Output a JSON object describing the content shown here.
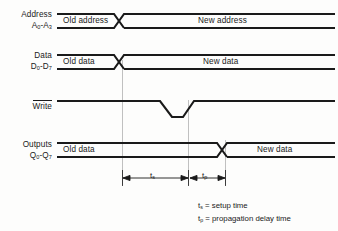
{
  "diagram": {
    "background_color": "#fdfdfc",
    "line_color": "#1a1a1a",
    "guide_color": "#b4b4b4",
    "signals": [
      {
        "name": "address",
        "label_line1": "Address",
        "label_line2_main": "A",
        "label_line2_sub1": "0",
        "label_line2_dash": "-A",
        "label_line2_sub2": "3",
        "old_value": "Old address",
        "new_value": "New address",
        "type": "bus"
      },
      {
        "name": "data",
        "label_line1": "Data",
        "label_line2_main": "D",
        "label_line2_sub1": "0",
        "label_line2_dash": "-D",
        "label_line2_sub2": "7",
        "old_value": "Old data",
        "new_value": "New data",
        "type": "bus"
      },
      {
        "name": "write",
        "label_line1": "Write",
        "active_low": true,
        "type": "pulse"
      },
      {
        "name": "outputs",
        "label_line1": "Outputs",
        "label_line2_main": "Q",
        "label_line2_sub1": "0",
        "label_line2_dash": "-Q",
        "label_line2_sub2": "7",
        "old_value": "Old data",
        "new_value": "New data",
        "type": "bus"
      }
    ],
    "dimensions": [
      {
        "name": "setup-time",
        "symbol": "t",
        "subscript": "s"
      },
      {
        "name": "propagation-delay",
        "symbol": "t",
        "subscript": "p"
      }
    ],
    "legend": [
      {
        "symbol": "t",
        "subscript": "s",
        "equals": "=",
        "description": "setup time"
      },
      {
        "symbol": "t",
        "subscript": "p",
        "equals": "=",
        "description": "propagation delay time"
      }
    ]
  }
}
